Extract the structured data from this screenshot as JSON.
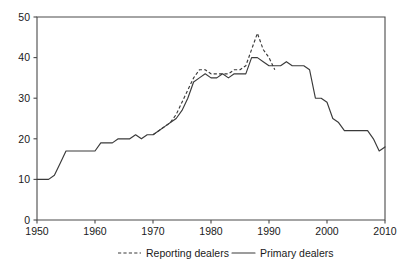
{
  "chart_data": {
    "type": "line",
    "title": "",
    "xlabel": "",
    "ylabel": "",
    "xlim": [
      1950,
      2010
    ],
    "ylim": [
      0,
      50
    ],
    "grid": false,
    "legend_position": "bottom",
    "xticks": [
      "1950",
      "1960",
      "1970",
      "1980",
      "1990",
      "2000",
      "2010"
    ],
    "xtick_values": [
      1950,
      1960,
      1970,
      1980,
      1990,
      2000,
      2010
    ],
    "yticks": [
      "0",
      "10",
      "20",
      "30",
      "40",
      "50"
    ],
    "ytick_values": [
      0,
      10,
      20,
      30,
      40,
      50
    ],
    "series": [
      {
        "name": "Reporting dealers",
        "style": "dashed",
        "color": "#3a3a3a",
        "x": [
          1970,
          1971,
          1972,
          1973,
          1974,
          1975,
          1976,
          1977,
          1978,
          1979,
          1980,
          1981,
          1982,
          1983,
          1984,
          1985,
          1986,
          1987,
          1988,
          1989,
          1990,
          1991
        ],
        "values": [
          21,
          22,
          23,
          24,
          26,
          29,
          32,
          35,
          37,
          37,
          36,
          36,
          36,
          36,
          37,
          37,
          38,
          42,
          46,
          42,
          40,
          37
        ]
      },
      {
        "name": "Primary dealers",
        "style": "solid",
        "color": "#3a3a3a",
        "x": [
          1950,
          1951,
          1952,
          1953,
          1954,
          1955,
          1956,
          1957,
          1958,
          1959,
          1960,
          1961,
          1962,
          1963,
          1964,
          1965,
          1966,
          1967,
          1968,
          1969,
          1970,
          1971,
          1972,
          1973,
          1974,
          1975,
          1976,
          1977,
          1978,
          1979,
          1980,
          1981,
          1982,
          1983,
          1984,
          1985,
          1986,
          1987,
          1988,
          1989,
          1990,
          1991,
          1992,
          1993,
          1994,
          1995,
          1996,
          1997,
          1998,
          1999,
          2000,
          2001,
          2002,
          2003,
          2004,
          2005,
          2006,
          2007,
          2008,
          2009,
          2010
        ],
        "values": [
          10,
          10,
          10,
          11,
          14,
          17,
          17,
          17,
          17,
          17,
          17,
          19,
          19,
          19,
          20,
          20,
          20,
          21,
          20,
          21,
          21,
          22,
          23,
          24,
          25,
          27,
          30,
          34,
          35,
          36,
          35,
          35,
          36,
          35,
          36,
          36,
          36,
          40,
          40,
          39,
          38,
          38,
          38,
          39,
          38,
          38,
          38,
          37,
          30,
          30,
          29,
          25,
          24,
          22,
          22,
          22,
          22,
          22,
          20,
          17,
          18
        ]
      }
    ],
    "legend": [
      {
        "label": "Reporting dealers",
        "style": "dashed"
      },
      {
        "label": "Primary dealers",
        "style": "solid"
      }
    ]
  }
}
